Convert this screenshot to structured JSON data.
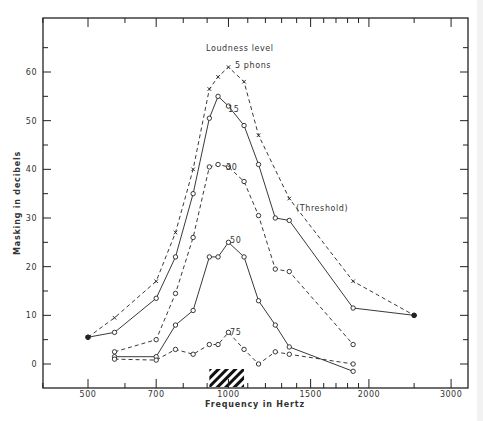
{
  "chart_data": {
    "type": "line",
    "title": "",
    "xlabel": "Frequency in Hertz",
    "ylabel": "Masking in decibels",
    "xscale": "log",
    "xlim": [
      375,
      3400
    ],
    "ylim": [
      -5,
      70
    ],
    "x_ticks": [
      500,
      700,
      1000,
      1500,
      2000,
      3000
    ],
    "x_tick_labels": [
      "500",
      "700",
      "1000",
      "1500",
      "2000",
      "3000"
    ],
    "y_ticks": [
      0,
      10,
      20,
      30,
      40,
      50,
      60
    ],
    "y_tick_labels": [
      "0",
      "10",
      "20",
      "30",
      "40",
      "50",
      "60"
    ],
    "grid": false,
    "legend_title": "Loudness level",
    "masking_band": {
      "x_start": 910,
      "x_end": 1080,
      "style": "hatched"
    },
    "series": [
      {
        "name": "5 phons (Threshold)",
        "label": "5 phons",
        "marker": "x",
        "line": "dashed",
        "x": [
          500,
          570,
          700,
          770,
          840,
          910,
          950,
          1000,
          1080,
          1160,
          1350,
          1850,
          2500
        ],
        "y": [
          5.5,
          9.5,
          17,
          27,
          40,
          56.5,
          59,
          61,
          58,
          47,
          34,
          17,
          10
        ]
      },
      {
        "name": "15 phons",
        "label": "15",
        "marker": "o",
        "line": "solid",
        "x": [
          500,
          570,
          700,
          770,
          840,
          910,
          950,
          1000,
          1080,
          1160,
          1260,
          1350,
          1850,
          2500
        ],
        "y": [
          5.5,
          6.5,
          13.5,
          22,
          35,
          50.5,
          55,
          53,
          49,
          41,
          30,
          29.5,
          11.5,
          10
        ]
      },
      {
        "name": "30 phons",
        "label": "30",
        "marker": "o",
        "line": "dashed",
        "x": [
          570,
          700,
          770,
          840,
          910,
          950,
          1000,
          1080,
          1160,
          1260,
          1350,
          1850
        ],
        "y": [
          2.5,
          5,
          14.5,
          26,
          40.5,
          41,
          40.5,
          37.5,
          30.5,
          19.5,
          19,
          4
        ]
      },
      {
        "name": "50 phons",
        "label": "50",
        "marker": "o",
        "line": "solid",
        "x": [
          570,
          700,
          770,
          840,
          910,
          950,
          1000,
          1080,
          1160,
          1260,
          1350,
          1850
        ],
        "y": [
          1.5,
          1.5,
          8,
          11,
          22,
          22,
          25,
          22,
          13,
          8,
          3.5,
          -1.5
        ]
      },
      {
        "name": "75 phons",
        "label": "75",
        "marker": "o",
        "line": "dashed",
        "x": [
          570,
          700,
          770,
          840,
          910,
          950,
          1000,
          1080,
          1160,
          1260,
          1350,
          1850
        ],
        "y": [
          1,
          0.8,
          3,
          2,
          4,
          4,
          6.5,
          3,
          0,
          2.5,
          2,
          0
        ]
      }
    ],
    "annotations": [
      {
        "text": "Loudness level",
        "x": 1000,
        "y": 65
      },
      {
        "text": "5 phons",
        "x": 1060,
        "y": 61.5
      },
      {
        "text": "15",
        "x": 1030,
        "y": 52.5
      },
      {
        "text": "30",
        "x": 1030,
        "y": 40.5
      },
      {
        "text": "50",
        "x": 1020,
        "y": 25.5
      },
      {
        "text": "75",
        "x": 1020,
        "y": 6.5
      },
      {
        "text": "(Threshold)",
        "x": 1450,
        "y": 32
      }
    ]
  }
}
